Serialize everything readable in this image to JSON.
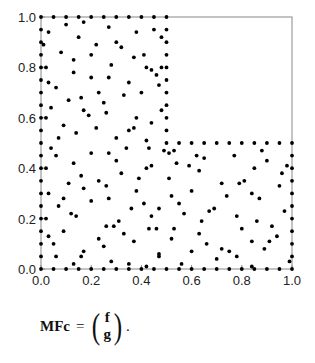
{
  "chart_data": {
    "type": "scatter",
    "title": "",
    "xlabel": "",
    "ylabel": "",
    "xlim": [
      0,
      1
    ],
    "ylim": [
      0,
      1
    ],
    "grid": false,
    "legend": null,
    "x_ticks": [
      "0.0",
      "0.2",
      "0.4",
      "0.6",
      "0.8",
      "1.0"
    ],
    "y_ticks": [
      "0.0",
      "0.2",
      "0.4",
      "0.6",
      "0.8",
      "1.0"
    ],
    "domain_shape": "L-shaped: [0,0.5]x[0,1] union [0.5,1]x[0,0.5]",
    "series": [
      {
        "name": "boundary points",
        "points": [
          [
            0.0,
            0.0
          ],
          [
            0.05,
            0.0
          ],
          [
            0.1,
            0.0
          ],
          [
            0.15,
            0.0
          ],
          [
            0.2,
            0.0
          ],
          [
            0.25,
            0.0
          ],
          [
            0.3,
            0.0
          ],
          [
            0.35,
            0.0
          ],
          [
            0.4,
            0.0
          ],
          [
            0.45,
            0.0
          ],
          [
            0.5,
            0.0
          ],
          [
            0.55,
            0.0
          ],
          [
            0.6,
            0.0
          ],
          [
            0.65,
            0.0
          ],
          [
            0.7,
            0.0
          ],
          [
            0.75,
            0.0
          ],
          [
            0.8,
            0.0
          ],
          [
            0.85,
            0.0
          ],
          [
            0.9,
            0.0
          ],
          [
            0.95,
            0.0
          ],
          [
            1.0,
            0.0
          ],
          [
            1.0,
            0.05
          ],
          [
            1.0,
            0.1
          ],
          [
            1.0,
            0.15
          ],
          [
            1.0,
            0.2
          ],
          [
            1.0,
            0.25
          ],
          [
            1.0,
            0.3
          ],
          [
            1.0,
            0.35
          ],
          [
            1.0,
            0.4
          ],
          [
            1.0,
            0.45
          ],
          [
            1.0,
            0.5
          ],
          [
            0.95,
            0.5
          ],
          [
            0.9,
            0.5
          ],
          [
            0.85,
            0.5
          ],
          [
            0.8,
            0.5
          ],
          [
            0.75,
            0.5
          ],
          [
            0.7,
            0.5
          ],
          [
            0.65,
            0.5
          ],
          [
            0.6,
            0.5
          ],
          [
            0.55,
            0.5
          ],
          [
            0.5,
            0.5
          ],
          [
            0.5,
            0.55
          ],
          [
            0.5,
            0.6
          ],
          [
            0.5,
            0.65
          ],
          [
            0.5,
            0.7
          ],
          [
            0.5,
            0.75
          ],
          [
            0.5,
            0.8
          ],
          [
            0.5,
            0.85
          ],
          [
            0.5,
            0.9
          ],
          [
            0.5,
            0.95
          ],
          [
            0.5,
            1.0
          ],
          [
            0.45,
            1.0
          ],
          [
            0.4,
            1.0
          ],
          [
            0.35,
            1.0
          ],
          [
            0.3,
            1.0
          ],
          [
            0.25,
            1.0
          ],
          [
            0.2,
            1.0
          ],
          [
            0.15,
            1.0
          ],
          [
            0.1,
            1.0
          ],
          [
            0.05,
            1.0
          ],
          [
            0.0,
            1.0
          ],
          [
            0.0,
            0.95
          ],
          [
            0.0,
            0.9
          ],
          [
            0.0,
            0.85
          ],
          [
            0.0,
            0.8
          ],
          [
            0.0,
            0.75
          ],
          [
            0.0,
            0.7
          ],
          [
            0.0,
            0.65
          ],
          [
            0.0,
            0.6
          ],
          [
            0.0,
            0.55
          ],
          [
            0.0,
            0.5
          ],
          [
            0.0,
            0.45
          ],
          [
            0.0,
            0.4
          ],
          [
            0.0,
            0.35
          ],
          [
            0.0,
            0.3
          ],
          [
            0.0,
            0.25
          ],
          [
            0.0,
            0.2
          ],
          [
            0.0,
            0.15
          ],
          [
            0.0,
            0.1
          ],
          [
            0.0,
            0.05
          ]
        ]
      },
      {
        "name": "interior points",
        "points": [
          [
            0.03,
            0.94
          ],
          [
            0.1,
            0.97
          ],
          [
            0.15,
            0.92
          ],
          [
            0.17,
            0.98
          ],
          [
            0.27,
            0.96
          ],
          [
            0.22,
            0.89
          ],
          [
            0.3,
            0.9
          ],
          [
            0.32,
            0.88
          ],
          [
            0.38,
            0.94
          ],
          [
            0.45,
            0.95
          ],
          [
            0.48,
            0.92
          ],
          [
            0.01,
            0.89
          ],
          [
            0.08,
            0.86
          ],
          [
            0.2,
            0.85
          ],
          [
            0.13,
            0.83
          ],
          [
            0.28,
            0.81
          ],
          [
            0.37,
            0.84
          ],
          [
            0.41,
            0.85
          ],
          [
            0.42,
            0.8
          ],
          [
            0.44,
            0.79
          ],
          [
            0.48,
            0.8
          ],
          [
            0.02,
            0.8
          ],
          [
            0.13,
            0.78
          ],
          [
            0.2,
            0.76
          ],
          [
            0.27,
            0.76
          ],
          [
            0.35,
            0.74
          ],
          [
            0.47,
            0.73
          ],
          [
            0.03,
            0.74
          ],
          [
            0.06,
            0.72
          ],
          [
            0.23,
            0.7
          ],
          [
            0.4,
            0.7
          ],
          [
            0.46,
            0.77
          ],
          [
            0.33,
            0.69
          ],
          [
            0.16,
            0.68
          ],
          [
            0.11,
            0.67
          ],
          [
            0.25,
            0.66
          ],
          [
            0.04,
            0.64
          ],
          [
            0.17,
            0.63
          ],
          [
            0.26,
            0.62
          ],
          [
            0.19,
            0.61
          ],
          [
            0.38,
            0.6
          ],
          [
            0.02,
            0.6
          ],
          [
            0.44,
            0.58
          ],
          [
            0.48,
            0.63
          ],
          [
            0.22,
            0.56
          ],
          [
            0.09,
            0.57
          ],
          [
            0.35,
            0.55
          ],
          [
            0.37,
            0.56
          ],
          [
            0.14,
            0.54
          ],
          [
            0.3,
            0.52
          ],
          [
            0.42,
            0.51
          ],
          [
            0.07,
            0.52
          ],
          [
            0.04,
            0.48
          ],
          [
            0.34,
            0.48
          ],
          [
            0.43,
            0.48
          ],
          [
            0.06,
            0.45
          ],
          [
            0.2,
            0.46
          ],
          [
            0.27,
            0.46
          ],
          [
            0.3,
            0.43
          ],
          [
            0.13,
            0.42
          ],
          [
            0.02,
            0.4
          ],
          [
            0.42,
            0.4
          ],
          [
            0.44,
            0.41
          ],
          [
            0.32,
            0.38
          ],
          [
            0.11,
            0.34
          ],
          [
            0.23,
            0.35
          ],
          [
            0.16,
            0.37
          ],
          [
            0.26,
            0.33
          ],
          [
            0.17,
            0.32
          ],
          [
            0.39,
            0.36
          ],
          [
            0.38,
            0.31
          ],
          [
            0.03,
            0.3
          ],
          [
            0.09,
            0.28
          ],
          [
            0.27,
            0.28
          ],
          [
            0.2,
            0.27
          ],
          [
            0.41,
            0.26
          ],
          [
            0.07,
            0.25
          ],
          [
            0.36,
            0.24
          ],
          [
            0.12,
            0.22
          ],
          [
            0.14,
            0.21
          ],
          [
            0.44,
            0.21
          ],
          [
            0.02,
            0.2
          ],
          [
            0.26,
            0.17
          ],
          [
            0.29,
            0.17
          ],
          [
            0.31,
            0.19
          ],
          [
            0.43,
            0.16
          ],
          [
            0.09,
            0.15
          ],
          [
            0.03,
            0.13
          ],
          [
            0.23,
            0.12
          ],
          [
            0.33,
            0.14
          ],
          [
            0.05,
            0.1
          ],
          [
            0.25,
            0.09
          ],
          [
            0.37,
            0.11
          ],
          [
            0.17,
            0.07
          ],
          [
            0.16,
            0.05
          ],
          [
            0.06,
            0.05
          ],
          [
            0.28,
            0.03
          ],
          [
            0.13,
            0.02
          ],
          [
            0.35,
            0.02
          ],
          [
            0.42,
            0.01
          ],
          [
            0.47,
            0.05
          ],
          [
            0.51,
            0.46
          ],
          [
            0.53,
            0.47
          ],
          [
            0.49,
            0.47
          ],
          [
            0.62,
            0.45
          ],
          [
            0.65,
            0.44
          ],
          [
            0.77,
            0.45
          ],
          [
            0.54,
            0.42
          ],
          [
            0.59,
            0.41
          ],
          [
            0.88,
            0.47
          ],
          [
            0.9,
            0.43
          ],
          [
            0.98,
            0.41
          ],
          [
            0.85,
            0.4
          ],
          [
            0.96,
            0.38
          ],
          [
            0.63,
            0.39
          ],
          [
            0.51,
            0.36
          ],
          [
            0.72,
            0.34
          ],
          [
            0.79,
            0.34
          ],
          [
            0.81,
            0.35
          ],
          [
            0.6,
            0.31
          ],
          [
            0.95,
            0.33
          ],
          [
            0.52,
            0.29
          ],
          [
            0.74,
            0.29
          ],
          [
            0.84,
            0.3
          ],
          [
            0.87,
            0.28
          ],
          [
            0.55,
            0.26
          ],
          [
            0.47,
            0.24
          ],
          [
            0.69,
            0.24
          ],
          [
            0.67,
            0.23
          ],
          [
            0.57,
            0.22
          ],
          [
            0.97,
            0.23
          ],
          [
            0.78,
            0.21
          ],
          [
            0.64,
            0.19
          ],
          [
            0.86,
            0.19
          ],
          [
            0.92,
            0.17
          ],
          [
            0.46,
            0.16
          ],
          [
            0.53,
            0.16
          ],
          [
            0.8,
            0.16
          ],
          [
            0.63,
            0.14
          ],
          [
            0.94,
            0.13
          ],
          [
            0.84,
            0.11
          ],
          [
            0.52,
            0.12
          ],
          [
            0.91,
            0.11
          ],
          [
            0.66,
            0.1
          ],
          [
            0.89,
            0.08
          ],
          [
            0.47,
            0.06
          ],
          [
            0.6,
            0.07
          ],
          [
            0.72,
            0.08
          ],
          [
            0.75,
            0.07
          ],
          [
            0.7,
            0.04
          ],
          [
            0.78,
            0.05
          ],
          [
            0.99,
            0.03
          ],
          [
            0.56,
            0.02
          ],
          [
            0.84,
            0.01
          ]
        ]
      }
    ]
  },
  "formula": {
    "lhs": "MFc",
    "eq": "=",
    "top": "f",
    "bottom": "g",
    "trailing": "."
  }
}
